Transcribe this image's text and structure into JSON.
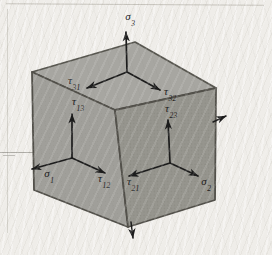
{
  "diagram": {
    "type": "stress-element-cube",
    "colors": {
      "paper": "#efede9",
      "face_top": "#a7a6a1",
      "face_left": "#a09f9a",
      "face_right": "#96958e",
      "edge": "#57564f",
      "arrow": "#1c1c1c",
      "label": "#21201d"
    },
    "labels": [
      {
        "id": "sigma-3",
        "base": "σ",
        "sub": "3"
      },
      {
        "id": "tau-31",
        "base": "τ",
        "sub": "31"
      },
      {
        "id": "tau-32",
        "base": "τ",
        "sub": "32"
      },
      {
        "id": "tau-13",
        "base": "τ",
        "sub": "13"
      },
      {
        "id": "sigma-1",
        "base": "σ",
        "sub": "1"
      },
      {
        "id": "tau-12",
        "base": "τ",
        "sub": "12"
      },
      {
        "id": "tau-23",
        "base": "τ",
        "sub": "23"
      },
      {
        "id": "tau-21",
        "base": "τ",
        "sub": "21"
      },
      {
        "id": "sigma-2",
        "base": "σ",
        "sub": "2"
      }
    ]
  }
}
